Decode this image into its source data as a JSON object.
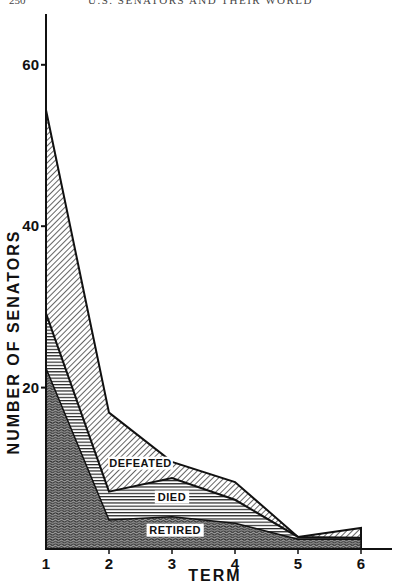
{
  "page_header": {
    "page_number": "250",
    "running_head": "U.S. SENATORS AND THEIR WORLD"
  },
  "chart_data": {
    "type": "area",
    "stacked": true,
    "title": "",
    "xlabel": "TERM",
    "ylabel": "NUMBER OF SENATORS",
    "x": [
      1,
      2,
      3,
      4,
      5,
      6
    ],
    "x_tick_labels": [
      "1",
      "2",
      "3",
      "4",
      "5",
      "6"
    ],
    "y_ticks": [
      20,
      40,
      60
    ],
    "y_tick_labels": [
      "20",
      "40",
      "60"
    ],
    "ylim": [
      0,
      66
    ],
    "xlim": [
      1,
      6.5
    ],
    "grid": false,
    "legend": "inline labels inside areas",
    "series": [
      {
        "name": "RETIRED",
        "pattern": "wavy-dense",
        "values": [
          22.4,
          3.6,
          4.0,
          3.2,
          1.2,
          1.2
        ]
      },
      {
        "name": "DIED",
        "pattern": "horizontal-lines",
        "values": [
          6.8,
          3.5,
          4.8,
          2.9,
          0.3,
          0.2
        ]
      },
      {
        "name": "DEFEATED",
        "pattern": "diagonal-lines",
        "values": [
          25.2,
          9.8,
          2.0,
          2.2,
          0.0,
          1.2
        ]
      }
    ],
    "cumulative_top": {
      "RETIRED": [
        22.4,
        3.6,
        4.0,
        3.2,
        1.2,
        1.2
      ],
      "DIED": [
        29.2,
        7.1,
        8.8,
        6.1,
        1.5,
        1.4
      ],
      "DEFEATED": [
        54.4,
        16.9,
        10.8,
        8.3,
        1.5,
        2.6
      ]
    },
    "annotations": [
      {
        "text": "DEFEATED",
        "term": 2.5,
        "y": 10.2
      },
      {
        "text": "DIED",
        "term": 3.0,
        "y": 6.0
      },
      {
        "text": "RETIRED",
        "term": 3.05,
        "y": 1.9
      }
    ]
  }
}
